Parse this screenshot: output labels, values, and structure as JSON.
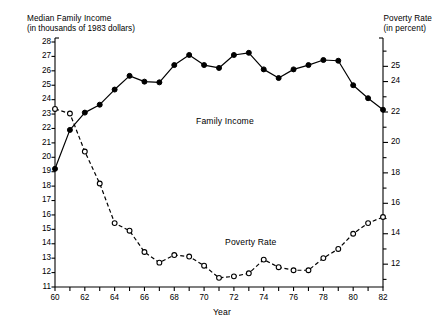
{
  "titles": {
    "left_line1": "Median Family Income",
    "left_line2": "(in thousands of 1983 dollars)",
    "right_line1": "Poverty Rate",
    "right_line2": "(in percent)"
  },
  "labels": {
    "family_income": "Family Income",
    "poverty_rate": "Poverty Rate",
    "xaxis": "Year"
  },
  "chart_data": {
    "type": "line",
    "xlabel": "Year",
    "grid": false,
    "legend": "inline-annotations",
    "x": [
      1960,
      1961,
      1962,
      1963,
      1964,
      1965,
      1966,
      1967,
      1968,
      1969,
      1970,
      1971,
      1972,
      1973,
      1974,
      1975,
      1976,
      1977,
      1978,
      1979,
      1980,
      1981,
      1982
    ],
    "x_tick_labels": [
      "60",
      "",
      "62",
      "",
      "64",
      "",
      "66",
      "",
      "68",
      "",
      "70",
      "",
      "72",
      "",
      "74",
      "",
      "76",
      "",
      "78",
      "",
      "80",
      "",
      "82"
    ],
    "x_labeled_years": [
      "60",
      "62",
      "64",
      "66",
      "68",
      "70",
      "72",
      "74",
      "76",
      "78",
      "80",
      "82"
    ],
    "series": [
      {
        "name": "Family Income",
        "axis": "left",
        "ylabel": "Median Family Income (in thousands of 1983 dollars)",
        "marker": "filled-circle",
        "linestyle": "solid",
        "color": "#000000",
        "ylim": [
          11,
          28
        ],
        "ytick_labels": [
          "11",
          "12",
          "13",
          "14",
          "15",
          "16",
          "17",
          "18",
          "19",
          "20",
          "21",
          "22",
          "23",
          "24",
          "25",
          "26",
          "27",
          "28"
        ],
        "values": [
          19.2,
          21.9,
          23.1,
          23.65,
          24.7,
          25.65,
          25.25,
          25.2,
          26.4,
          27.1,
          26.4,
          26.2,
          27.1,
          27.25,
          26.1,
          25.5,
          26.1,
          26.4,
          26.75,
          26.7,
          25.0,
          24.1,
          23.3
        ]
      },
      {
        "name": "Poverty Rate",
        "axis": "right",
        "ylabel": "Poverty Rate (in percent)",
        "marker": "open-circle",
        "linestyle": "dashed",
        "color": "#000000",
        "ylim": [
          10.5,
          26.6
        ],
        "ytick_labels": [
          "12",
          "14",
          "16",
          "18",
          "20",
          "22",
          "24",
          "25"
        ],
        "values": [
          22.2,
          21.9,
          19.4,
          17.3,
          14.7,
          14.2,
          12.8,
          12.1,
          12.6,
          12.5,
          11.9,
          11.1,
          11.2,
          11.4,
          12.3,
          11.8,
          11.6,
          11.6,
          12.4,
          13.0,
          14.0,
          14.7,
          15.1
        ]
      }
    ]
  }
}
